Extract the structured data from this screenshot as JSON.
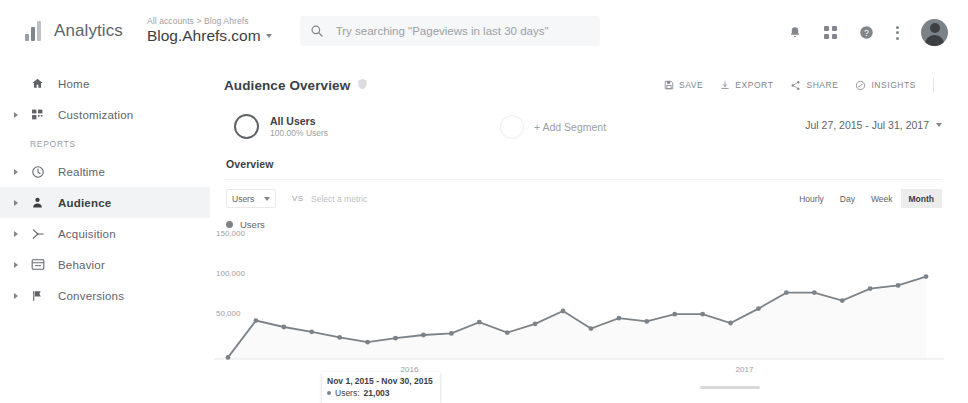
{
  "topbar": {
    "brand": "Analytics",
    "logo_icon": "analytics-bars-icon",
    "account_breadcrumb": "All accounts > Blog Ahrefs",
    "property_name": "Blog.Ahrefs.com",
    "search": {
      "icon": "search-icon",
      "placeholder": "Try searching \"Pageviews in last 30 days\""
    },
    "icons": {
      "notifications": "bell-icon",
      "apps": "apps-grid-icon",
      "help": "help-circle-icon",
      "more": "more-vertical-icon",
      "avatar": "user-avatar"
    }
  },
  "sidebar": {
    "items": [
      {
        "label": "Home",
        "icon": "home-icon",
        "expandable": false,
        "active": false
      },
      {
        "label": "Customization",
        "icon": "customization-icon",
        "expandable": true,
        "active": false
      }
    ],
    "section_label": "REPORTS",
    "reports": [
      {
        "label": "Realtime",
        "icon": "clock-icon",
        "expandable": true,
        "active": false
      },
      {
        "label": "Audience",
        "icon": "person-icon",
        "expandable": true,
        "active": true
      },
      {
        "label": "Acquisition",
        "icon": "acquisition-icon",
        "expandable": true,
        "active": false
      },
      {
        "label": "Behavior",
        "icon": "behavior-window-icon",
        "expandable": true,
        "active": false
      },
      {
        "label": "Conversions",
        "icon": "flag-icon",
        "expandable": true,
        "active": false
      }
    ]
  },
  "main": {
    "page_title": "Audience Overview",
    "page_title_icon": "shield-icon",
    "actions": [
      {
        "label": "SAVE",
        "icon": "save-floppy-icon"
      },
      {
        "label": "EXPORT",
        "icon": "export-download-icon"
      },
      {
        "label": "SHARE",
        "icon": "share-nodes-icon"
      },
      {
        "label": "INSIGHTS",
        "icon": "insights-icon"
      }
    ],
    "segment": {
      "name": "All Users",
      "subtitle": "100.00% Users",
      "add_label": "+ Add Segment"
    },
    "date_range": "Jul 27, 2015 - Jul 31, 2017",
    "tab": "Overview",
    "metric_select": "Users",
    "vs_label": "VS",
    "metric_placeholder": "Select a metric",
    "granularity": [
      {
        "label": "Hourly",
        "selected": false
      },
      {
        "label": "Day",
        "selected": false
      },
      {
        "label": "Week",
        "selected": false
      },
      {
        "label": "Month",
        "selected": true
      }
    ]
  },
  "chart_data": {
    "type": "line",
    "title": "",
    "legend": [
      "Users"
    ],
    "legend_position": "top-left",
    "xlabel": "",
    "ylabel": "",
    "ylim": [
      0,
      150000
    ],
    "yticks": [
      50000,
      100000,
      150000
    ],
    "ytick_labels": [
      "50,000",
      "100,000",
      "150,000"
    ],
    "xtick_labels": [
      "2016",
      "2017"
    ],
    "grid": false,
    "line_color": "#7b8288",
    "series": [
      {
        "name": "Users",
        "values": [
          2000,
          48000,
          40000,
          34000,
          27000,
          21003,
          26000,
          30000,
          32000,
          46000,
          33000,
          44000,
          60000,
          38000,
          51000,
          47000,
          56000,
          56000,
          45000,
          63000,
          83000,
          83000,
          73000,
          88000,
          92000,
          103000
        ]
      }
    ],
    "tooltip": {
      "title": "Nov 1, 2015 - Nov 30, 2015",
      "series_label": "Users:",
      "value": "21,003"
    }
  }
}
